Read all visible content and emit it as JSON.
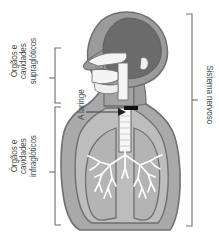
{
  "figure": {
    "background_color": "#ffffff"
  },
  "labels": {
    "supraglottic": {
      "line1": "Órgãos e",
      "line2": "cavidades",
      "line3": "supraglóticos"
    },
    "infraglottic": {
      "line1": "Órgãos e",
      "line2": "cavidades",
      "line3": "infraglóticos"
    },
    "larynx": {
      "text": "A laringe"
    },
    "nervous_system": {
      "text": "Sistema nervoso"
    }
  },
  "colors": {
    "text": "#4a4a4a",
    "bracket": "#6e6e6e",
    "body_fill": "#a9a9a9",
    "body_outline": "#6a6a6a",
    "brain_fill": "#6b6b6b",
    "skull_fill": "#9b9b9b",
    "cavity_fill": "#f2f2f2",
    "lung_fill": "#b4b4b4",
    "bronchi": "#ffffff",
    "marker": "#111111"
  },
  "brackets": {
    "supraglottic": {
      "top": 48,
      "bottom": 103,
      "tick": 78
    },
    "infraglottic": {
      "top": 107,
      "bottom": 225,
      "tick": 172
    },
    "nervous_system": {
      "top": 14,
      "bottom": 226,
      "tick": 100
    }
  },
  "annotations": {
    "larynx_arrow": {
      "from_x": 86,
      "to_x": 126,
      "y": 112
    },
    "larynx_marker": {
      "x": 124,
      "y": 108,
      "width": 14,
      "height": 4
    }
  }
}
